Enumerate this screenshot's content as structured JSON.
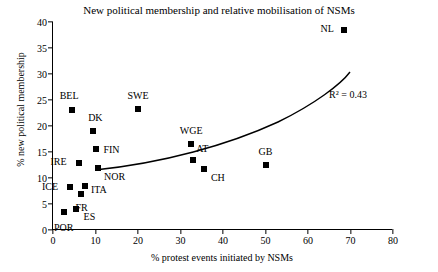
{
  "chart_data": {
    "type": "scatter",
    "title": "New political membership and relative mobilisation of NSMs",
    "xlabel": "% protest events initiated by NSMs",
    "ylabel": "% new political membership",
    "xlim": [
      0,
      80
    ],
    "ylim": [
      0,
      40
    ],
    "xticks": [
      0,
      10,
      20,
      30,
      40,
      50,
      60,
      70,
      80
    ],
    "yticks": [
      0,
      5,
      10,
      15,
      20,
      25,
      30,
      35,
      40
    ],
    "grid": false,
    "legend": null,
    "annotation": "R² = 0.43",
    "trendline": "exponential fit rising from about 11.5 at x=10 to about 33 at x=70",
    "points": [
      {
        "label": "POR",
        "x": 2.5,
        "y": 3.5,
        "label_pos": "below"
      },
      {
        "label": "ICE",
        "x": 4.0,
        "y": 8.3,
        "label_pos": "left"
      },
      {
        "label": "BEL",
        "x": 4.5,
        "y": 23.0,
        "label_pos": "above-left"
      },
      {
        "label": "ES",
        "x": 5.5,
        "y": 4.0,
        "label_pos": "right"
      },
      {
        "label": "IRE",
        "x": 6.0,
        "y": 12.8,
        "label_pos": "left"
      },
      {
        "label": "FR",
        "x": 6.5,
        "y": 7.0,
        "label_pos": "below"
      },
      {
        "label": "ITA",
        "x": 7.5,
        "y": 8.5,
        "label_pos": "right"
      },
      {
        "label": "DK",
        "x": 9.5,
        "y": 19.0,
        "label_pos": "above"
      },
      {
        "label": "FIN",
        "x": 10.0,
        "y": 15.5,
        "label_pos": "right"
      },
      {
        "label": "NOR",
        "x": 10.5,
        "y": 12.0,
        "label_pos": "below-right"
      },
      {
        "label": "SWE",
        "x": 20.0,
        "y": 23.3,
        "label_pos": "above"
      },
      {
        "label": "WGE",
        "x": 32.5,
        "y": 16.5,
        "label_pos": "above"
      },
      {
        "label": "AT",
        "x": 33.0,
        "y": 13.5,
        "label_pos": "above-right"
      },
      {
        "label": "CH",
        "x": 35.5,
        "y": 11.8,
        "label_pos": "right"
      },
      {
        "label": "GB",
        "x": 50.0,
        "y": 12.5,
        "label_pos": "above"
      },
      {
        "label": "NL",
        "x": 68.5,
        "y": 38.5,
        "label_pos": "left"
      }
    ]
  }
}
